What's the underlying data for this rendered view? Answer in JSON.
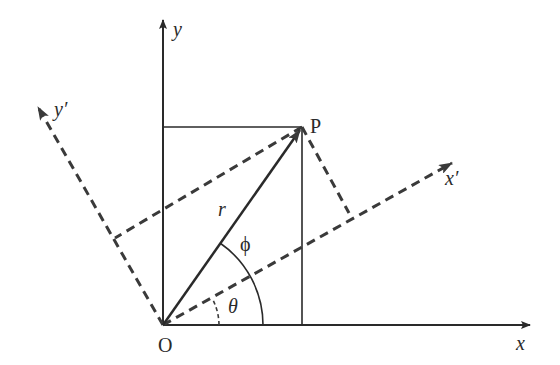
{
  "diagram": {
    "type": "coordinate-rotation",
    "colors": {
      "line": "#2a2a2a",
      "dashed": "#3a3a3a",
      "background": "#ffffff"
    },
    "labels": {
      "origin": "O",
      "point": "P",
      "x_axis": "x",
      "y_axis": "y",
      "x_prime_axis": "x′",
      "y_prime_axis": "y′",
      "radius": "r",
      "phi": "ϕ",
      "theta": "θ"
    }
  }
}
